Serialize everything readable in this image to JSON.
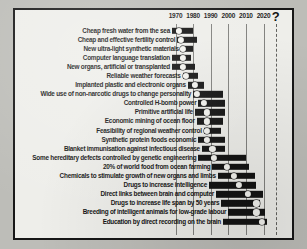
{
  "chart_data": {
    "type": "bar",
    "title": "",
    "subtitle": "",
    "xlabel": "",
    "ylabel": "",
    "orientation": "horizontal",
    "bar_style": "range-bar-with-median-marker",
    "xlim": [
      1963,
      2028
    ],
    "grid": true,
    "legend": "none",
    "axis_ticks": [
      {
        "label": "1970",
        "value": 1970
      },
      {
        "label": "1980",
        "value": 1980
      },
      {
        "label": "1990",
        "value": 1990
      },
      {
        "label": "2000",
        "value": 2000
      },
      {
        "label": "2010",
        "value": 2010
      },
      {
        "label": "2020",
        "value": 2020
      },
      {
        "label": "?",
        "value": 2027
      }
    ],
    "categories": [
      "Cheap fresh water from the sea",
      "Cheap and effective fertility control",
      "New ultra-light synthetic materials",
      "Computer language translation",
      "New organs, artificial or transplanted",
      "Reliable weather forecasts",
      "Implanted plastic and electronic organs",
      "Wide use of non-narcotic drugs to change personality",
      "Controlled H-bomb power",
      "Primitive artificial life",
      "Economic mining of ocean floor",
      "Feasibility of regional weather control",
      "Synthetic protein foods economic",
      "Blanket immunisation against infectious disease",
      "Some hereditary defects controlled by genetic engineering",
      "20% of world food from ocean farming",
      "Chemicals to stimulate growth of new organs and limbs",
      "Drugs to increase intelligence",
      "Direct links between brain and computer",
      "Drugs to increase life span by 50 years",
      "Breeding of intelligent animals for low-grade labour",
      "Education by direct recording on the brain"
    ],
    "series": [
      {
        "name": "Forecast range (quartile span) with median year",
        "ranges": [
          {
            "start": 1968,
            "median": 1972,
            "end": 1980
          },
          {
            "start": 1971,
            "median": 1973,
            "end": 1982
          },
          {
            "start": 1973,
            "median": 1974,
            "end": 1980
          },
          {
            "start": 1968,
            "median": 1974,
            "end": 1979
          },
          {
            "start": 1968,
            "median": 1974,
            "end": 1981
          },
          {
            "start": 1974,
            "median": 1976,
            "end": 1983
          },
          {
            "start": 1977,
            "median": 1981,
            "end": 1986
          },
          {
            "start": 1980,
            "median": 1982,
            "end": 1997
          },
          {
            "start": 1983,
            "median": 1986,
            "end": 1998
          },
          {
            "start": 1981,
            "median": 1988,
            "end": 1998
          },
          {
            "start": 1982,
            "median": 1988,
            "end": 1997
          },
          {
            "start": 1986,
            "median": 1988,
            "end": 1996
          },
          {
            "start": 1983,
            "median": 1988,
            "end": 1998
          },
          {
            "start": 1985,
            "median": 1991,
            "end": 1998
          },
          {
            "start": 1983,
            "median": 1992,
            "end": 2010
          },
          {
            "start": 1991,
            "median": 1999,
            "end": 2012
          },
          {
            "start": 1994,
            "median": 2003,
            "end": 2015
          },
          {
            "start": 1989,
            "median": 2006,
            "end": 2016
          },
          {
            "start": 1993,
            "median": 2011,
            "end": 2020
          },
          {
            "start": 1996,
            "median": 2016,
            "end": 2018
          },
          {
            "start": 2000,
            "median": 2016,
            "end": 2021
          },
          {
            "start": 1997,
            "median": 2019,
            "end": 2022
          }
        ]
      }
    ]
  }
}
